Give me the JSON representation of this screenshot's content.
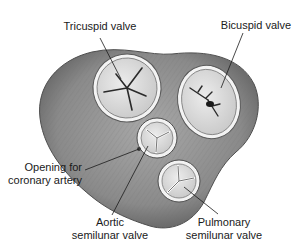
{
  "diagram": {
    "labels": {
      "tricuspid": "Tricuspid valve",
      "bicuspid": "Bicuspid valve",
      "coronary_line1": "Opening for",
      "coronary_line2": "coronary artery",
      "aortic_line1": "Aortic",
      "aortic_line2": "semilunar valve",
      "pulmonary_line1": "Pulmonary",
      "pulmonary_line2": "semilunar valve"
    },
    "colors": {
      "background": "#ffffff",
      "tissue": "#8a8a8a",
      "tissue_dark": "#5e5e5e",
      "valve_face": "#e2e2e2",
      "valve_ring": "#f4f4f4",
      "leader_line": "#1a1a1a",
      "text": "#1a1a1a"
    }
  }
}
